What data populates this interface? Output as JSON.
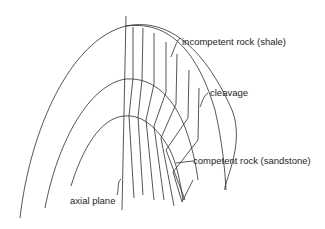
{
  "diagram": {
    "type": "geological fold cross-section (anticline) with axial-planar cleavage",
    "labels": {
      "incompetent": "incompetent rock (shale)",
      "cleavage": "cleavage",
      "competent": "competent rock (sandstone)",
      "axial_plane": "axial plane"
    },
    "colors": {
      "line": "#2a2a2a",
      "text": "#1e1e1e",
      "background": "#ffffff"
    }
  }
}
